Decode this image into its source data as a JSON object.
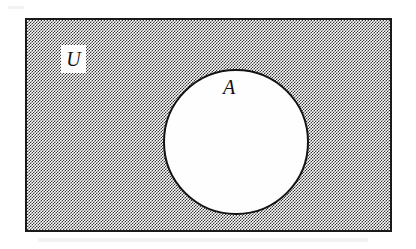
{
  "figure": {
    "type": "venn-diagram",
    "background_color": "#ffffff"
  },
  "universe": {
    "label": "U",
    "shaded": true,
    "shade_style": "checkerboard-dither-50-percent",
    "border_color": "#1a1a1a",
    "fill_color": "#2b2b2b",
    "label_patch_color": "#fdfdfd"
  },
  "sets": [
    {
      "label": "A",
      "shape": "circle",
      "shaded": false,
      "fill_color": "#fefefe",
      "border_color": "#141414"
    }
  ]
}
